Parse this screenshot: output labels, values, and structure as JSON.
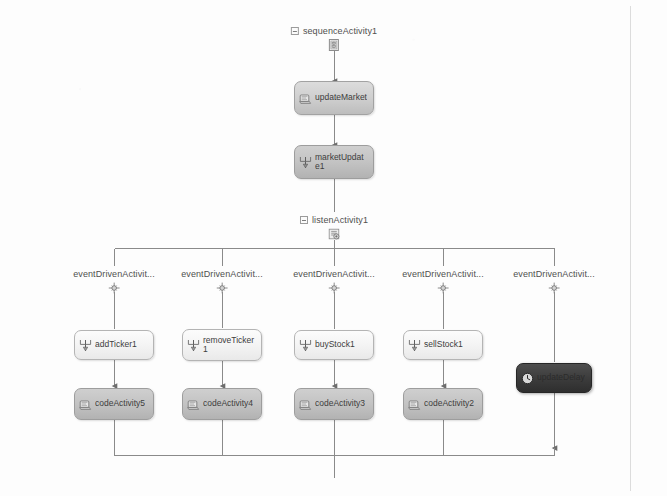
{
  "diagram": {
    "title": "sequenceActivity1",
    "type": "workflow-designer-canvas",
    "composites": [
      {
        "name": "sequence-activity-1",
        "label": "sequenceActivity1",
        "icon": "sequence-activity-icon",
        "x": 334,
        "y": 26
      },
      {
        "name": "listen-activity-1",
        "label": "listenActivity1",
        "icon": "listen-activity-icon",
        "x": 334,
        "y": 215
      },
      {
        "name": "event-driven-activity-1",
        "label": "eventDrivenActivit...",
        "icon": "event-driven-activity-icon",
        "x": 114,
        "y": 269
      },
      {
        "name": "event-driven-activity-2",
        "label": "eventDrivenActivit...",
        "icon": "event-driven-activity-icon",
        "x": 222,
        "y": 269
      },
      {
        "name": "event-driven-activity-3",
        "label": "eventDrivenActivit...",
        "icon": "event-driven-activity-icon",
        "x": 334,
        "y": 269
      },
      {
        "name": "event-driven-activity-4",
        "label": "eventDrivenActivit...",
        "icon": "event-driven-activity-icon",
        "x": 443,
        "y": 269
      },
      {
        "name": "event-driven-activity-5",
        "label": "eventDrivenActivit...",
        "icon": "event-driven-activity-icon",
        "x": 554,
        "y": 269
      }
    ],
    "activities": [
      {
        "name": "update-market-activity",
        "label": "updateMarket",
        "icon": "code-activity-icon",
        "style": "mid",
        "cx": 334,
        "cy": 98,
        "w": 80,
        "h": 34,
        "selected": false
      },
      {
        "name": "market-update-activity",
        "label": "marketUpdate1",
        "icon": "handle-event-icon",
        "style": "shaded",
        "cx": 334,
        "cy": 162,
        "w": 80,
        "h": 34,
        "selected": false
      },
      {
        "name": "add-ticker-activity",
        "label": "addTicker1",
        "icon": "handle-event-icon",
        "style": "light",
        "cx": 114,
        "cy": 345,
        "w": 80,
        "h": 30,
        "selected": false
      },
      {
        "name": "code-activity-5",
        "label": "codeActivity5",
        "icon": "code-activity-icon",
        "style": "shaded",
        "cx": 114,
        "cy": 404,
        "w": 80,
        "h": 32,
        "selected": false
      },
      {
        "name": "remove-ticker-activity",
        "label": "removeTicker1",
        "icon": "handle-event-icon",
        "style": "light",
        "cx": 222,
        "cy": 345,
        "w": 80,
        "h": 32,
        "selected": false
      },
      {
        "name": "code-activity-4",
        "label": "codeActivity4",
        "icon": "code-activity-icon",
        "style": "shaded",
        "cx": 222,
        "cy": 404,
        "w": 80,
        "h": 32,
        "selected": false
      },
      {
        "name": "buy-stock-activity",
        "label": "buyStock1",
        "icon": "handle-event-icon",
        "style": "light",
        "cx": 334,
        "cy": 345,
        "w": 80,
        "h": 30,
        "selected": false
      },
      {
        "name": "code-activity-3",
        "label": "codeActivity3",
        "icon": "code-activity-icon",
        "style": "shaded",
        "cx": 334,
        "cy": 404,
        "w": 80,
        "h": 32,
        "selected": false
      },
      {
        "name": "sell-stock-activity",
        "label": "sellStock1",
        "icon": "handle-event-icon",
        "style": "light",
        "cx": 443,
        "cy": 345,
        "w": 80,
        "h": 30,
        "selected": false
      },
      {
        "name": "code-activity-2",
        "label": "codeActivity2",
        "icon": "code-activity-icon",
        "style": "shaded",
        "cx": 443,
        "cy": 404,
        "w": 80,
        "h": 32,
        "selected": false
      },
      {
        "name": "update-delay-activity",
        "label": "updateDelay",
        "icon": "delay-activity-icon",
        "style": "dark",
        "cx": 554,
        "cy": 378,
        "w": 76,
        "h": 30,
        "selected": true
      }
    ]
  }
}
